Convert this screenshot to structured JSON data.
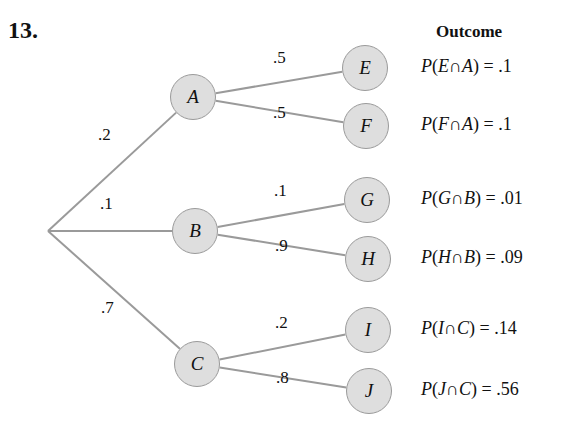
{
  "problem_number": "13.",
  "outcome_header": "Outcome",
  "colors": {
    "branch_line": "#9a9a9a",
    "node_fill": "#dedede",
    "node_border": "#9a9a9a",
    "text": "#111111"
  },
  "tree": {
    "root": {
      "x": 48,
      "y": 231
    },
    "first_level": [
      {
        "id": "A",
        "label": "A",
        "prob": ".2",
        "x": 193,
        "y": 97,
        "prob_pos": {
          "x": 98,
          "y": 137
        }
      },
      {
        "id": "B",
        "label": "B",
        "prob": ".1",
        "x": 195,
        "y": 231,
        "prob_pos": {
          "x": 100,
          "y": 206
        }
      },
      {
        "id": "C",
        "label": "C",
        "prob": ".7",
        "x": 197,
        "y": 364,
        "prob_pos": {
          "x": 101,
          "y": 310
        }
      }
    ],
    "second_level": [
      {
        "id": "E",
        "label": "E",
        "parent": "A",
        "prob": ".5",
        "x": 365,
        "y": 68,
        "prob_pos": {
          "x": 273,
          "y": 60
        }
      },
      {
        "id": "F",
        "label": "F",
        "parent": "A",
        "prob": ".5",
        "x": 366,
        "y": 126,
        "prob_pos": {
          "x": 273,
          "y": 115
        }
      },
      {
        "id": "G",
        "label": "G",
        "parent": "B",
        "prob": ".1",
        "x": 367,
        "y": 200,
        "prob_pos": {
          "x": 274,
          "y": 193
        }
      },
      {
        "id": "H",
        "label": "H",
        "parent": "B",
        "prob": ".9",
        "x": 368,
        "y": 259,
        "prob_pos": {
          "x": 275,
          "y": 248
        }
      },
      {
        "id": "I",
        "label": "I",
        "parent": "C",
        "prob": ".2",
        "x": 368,
        "y": 330,
        "prob_pos": {
          "x": 275,
          "y": 325
        }
      },
      {
        "id": "J",
        "label": "J",
        "parent": "C",
        "prob": ".8",
        "x": 369,
        "y": 391,
        "prob_pos": {
          "x": 276,
          "y": 380
        }
      }
    ]
  },
  "outcomes": [
    {
      "event": "E",
      "given": "A",
      "value": ".1",
      "y": 68
    },
    {
      "event": "F",
      "given": "A",
      "value": ".1",
      "y": 126
    },
    {
      "event": "G",
      "given": "B",
      "value": ".01",
      "y": 200
    },
    {
      "event": "H",
      "given": "B",
      "value": ".09",
      "y": 259
    },
    {
      "event": "I",
      "given": "C",
      "value": ".14",
      "y": 330
    },
    {
      "event": "J",
      "given": "C",
      "value": ".56",
      "y": 391
    }
  ]
}
